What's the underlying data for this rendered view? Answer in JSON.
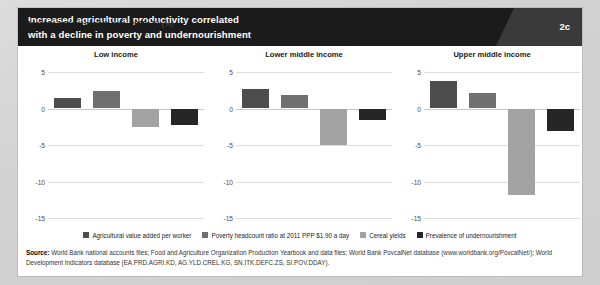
{
  "header": {
    "title_line1": "Increased agricultural productivity correlated",
    "title_line2": "with a decline in poverty and undernourishment",
    "badge": "2c"
  },
  "axis_label_main": "Average annual growth rate, 2000–12",
  "axis_label_unit": "(%)",
  "legend": [
    {
      "label": "Agricultural value added per worker",
      "color": "#4d4d4d"
    },
    {
      "label": "Poverty headcount ratio at 2011 PPP $1.90 a day",
      "color": "#707070"
    },
    {
      "label": "Cereal yields",
      "color": "#a3a3a3"
    },
    {
      "label": "Prevalence of undernourishment",
      "color": "#262626"
    }
  ],
  "source": {
    "label": "Source:",
    "text": " World Bank national accounts files; Food and Agriculture Organization Production Yearbook and data files; World Bank PovcalNet database (www.worldbank.org/PovcalNet/); World Development Indicators database (EA.PRD.AGRI.KD, AG.YLD.CREL.KG, SN.ITK.DEFC.ZS, SI.POV.DDAY)."
  },
  "chart_data": {
    "type": "bar",
    "title": "Increased agricultural productivity correlated with a decline in poverty and undernourishment",
    "ylabel": "Average annual growth rate, 2000–12 (%)",
    "xlabel": "",
    "ylim": [
      -15,
      5
    ],
    "yticks": [
      5,
      0,
      -5,
      -10,
      -15
    ],
    "ytick_labels": [
      "5",
      "0",
      "-5",
      "-10",
      "-15"
    ],
    "grid": true,
    "legend_position": "bottom",
    "categories": [
      "Agricultural value added per worker",
      "Poverty headcount ratio at 2011 PPP $1.90 a day",
      "Cereal yields",
      "Prevalence of undernourishment"
    ],
    "panels": [
      {
        "name": "Low income",
        "values": [
          1.4,
          2.4,
          -2.5,
          -2.3
        ]
      },
      {
        "name": "Lower middle income",
        "values": [
          2.7,
          1.8,
          -5.0,
          -1.6
        ]
      },
      {
        "name": "Upper middle income",
        "values": [
          3.7,
          2.1,
          -11.8,
          -3.1
        ]
      }
    ]
  }
}
